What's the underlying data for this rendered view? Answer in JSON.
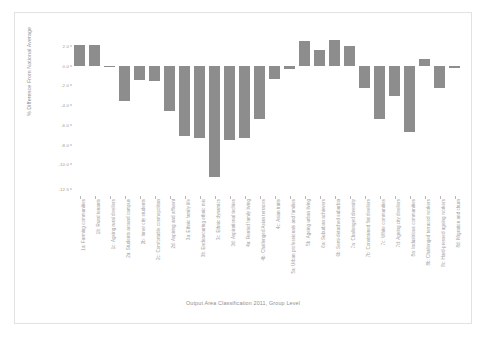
{
  "figure": {
    "background_color": "#ffffff",
    "bar_color": "#8d8d8d",
    "axis_text_color": "#9a9a9a"
  },
  "axes": {
    "ylabel": "% Difference From National Average",
    "xlabel": "Output Area Classification 2011, Group Level"
  },
  "chart_data": {
    "type": "bar",
    "title": "",
    "subtitle": "",
    "xlabel": "Output Area Classification 2011, Group Level",
    "ylabel": "% Difference From National Average",
    "orientation": "vertical",
    "grid": false,
    "legend": null,
    "ylim": [
      -13.2,
      3.0
    ],
    "yticks": [
      2.0,
      0.0,
      -2.0,
      -4.0,
      -6.0,
      -8.0,
      -10.0,
      -12.5
    ],
    "ytick_labels": [
      "2.0",
      "0.0",
      "-2.0",
      "-4.0",
      "-6.0",
      "-8.0",
      "-10.0",
      "-12.5"
    ],
    "categories": [
      "1a: Farming communities",
      "1b: Rural tenants",
      "1c: Ageing rural dwellers",
      "2a: Students around campus",
      "2b: Inner city students",
      "2c: Comfortable cosmopolitan",
      "2d: Aspiring and affluent",
      "3a: Ethnic family life",
      "3b: Endeavouring ethnic mix",
      "3c: Ethnic dynamics",
      "3d: Aspirational techies",
      "4a: Rented family living",
      "4b: Challenged Asian terraces",
      "4c: Asian traits",
      "5a: Urban professionals and families",
      "5b: Ageing urban living",
      "6a: Suburban achievers",
      "6b: Semi-detached suburbia",
      "7a: Challenged diversity",
      "7b: Constrained flat dwellers",
      "7c: White communities",
      "7d: Ageing city dwellers",
      "8a: Industrious communities",
      "8b: Challenged terraced workers",
      "8c: Hard-pressed ageing workers",
      "8d: Migration and churn"
    ],
    "values": [
      2.1,
      2.1,
      0.0,
      -3.6,
      -1.5,
      -1.6,
      -4.6,
      -7.1,
      -7.3,
      -11.3,
      -7.5,
      -7.3,
      -5.4,
      -1.4,
      -0.3,
      2.5,
      1.6,
      2.6,
      2.0,
      -2.3,
      -5.4,
      -3.1,
      -6.7,
      0.7,
      -2.3,
      -0.2
    ]
  }
}
